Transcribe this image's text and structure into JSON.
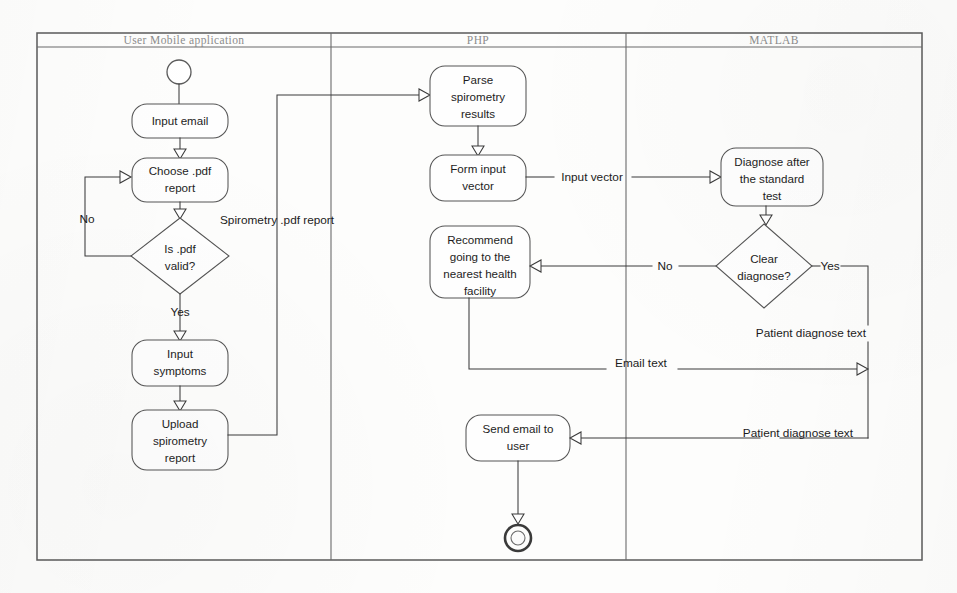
{
  "diagram": {
    "kind": "UML activity diagram with swimlanes",
    "frame": {
      "x": 37,
      "y": 33,
      "width": 885,
      "height": 527
    },
    "lanes": [
      {
        "id": "user",
        "title": "User Mobile application",
        "x": 37,
        "width": 294,
        "title_x": 184
      },
      {
        "id": "php",
        "title": "PHP",
        "x": 331,
        "width": 295,
        "title_x": 478
      },
      {
        "id": "matlab",
        "title": "MATLAB",
        "x": 626,
        "width": 296,
        "title_x": 774
      }
    ],
    "header_line_y": 47,
    "nodes": [
      {
        "id": "start",
        "type": "initial",
        "label": "",
        "cx": 179,
        "cy": 72,
        "r": 12
      },
      {
        "id": "input-email",
        "type": "action",
        "label": "Input email",
        "lines": [
          "Input email"
        ],
        "x": 132,
        "y": 104,
        "w": 96,
        "h": 34
      },
      {
        "id": "choose-pdf",
        "type": "action",
        "label": "Choose .pdf report",
        "lines": [
          "Choose .pdf",
          "report"
        ],
        "x": 132,
        "y": 158,
        "w": 96,
        "h": 44
      },
      {
        "id": "is-pdf-valid",
        "type": "decision",
        "label": "Is .pdf valid?",
        "lines": [
          "Is .pdf",
          "valid?"
        ],
        "cx": 180,
        "cy": 256,
        "rx": 49,
        "ry": 38
      },
      {
        "id": "input-symptoms",
        "type": "action",
        "label": "Input symptoms",
        "lines": [
          "Input",
          "symptoms"
        ],
        "x": 132,
        "y": 340,
        "w": 96,
        "h": 46
      },
      {
        "id": "upload-spirometry",
        "type": "action",
        "label": "Upload spirometry report",
        "lines": [
          "Upload",
          "spirometry",
          "report"
        ],
        "x": 132,
        "y": 410,
        "w": 96,
        "h": 60
      },
      {
        "id": "parse-spirometry",
        "type": "action",
        "label": "Parse spirometry results",
        "lines": [
          "Parse",
          "spirometry",
          "results"
        ],
        "x": 430,
        "y": 66,
        "w": 96,
        "h": 60
      },
      {
        "id": "form-input-vector",
        "type": "action",
        "label": "Form input vector",
        "lines": [
          "Form input",
          "vector"
        ],
        "x": 430,
        "y": 155,
        "w": 96,
        "h": 46
      },
      {
        "id": "recommend-facility",
        "type": "action",
        "label": "Recommend going to the nearest health facility",
        "lines": [
          "Recommend",
          "going to the",
          "nearest health",
          "facility"
        ],
        "x": 430,
        "y": 226,
        "w": 100,
        "h": 72
      },
      {
        "id": "send-email",
        "type": "action",
        "label": "Send email to user",
        "lines": [
          "Send email to",
          "user"
        ],
        "x": 466,
        "y": 415,
        "w": 104,
        "h": 46
      },
      {
        "id": "end",
        "type": "final",
        "label": "",
        "cx": 518,
        "cy": 538,
        "r": 14
      },
      {
        "id": "diagnose-standard",
        "type": "action",
        "label": "Diagnose after the standard test",
        "lines": [
          "Diagnose after",
          "the standard",
          "test"
        ],
        "x": 721,
        "y": 148,
        "w": 102,
        "h": 58
      },
      {
        "id": "clear-diagnose",
        "type": "decision",
        "label": "Clear diagnose?",
        "lines": [
          "Clear",
          "diagnose?"
        ],
        "cx": 764,
        "cy": 266,
        "rx": 48,
        "ry": 42
      }
    ],
    "edge_labels": [
      {
        "id": "no-pdf",
        "text": "No",
        "x": 87,
        "y": 223
      },
      {
        "id": "yes-pdf",
        "text": "Yes",
        "x": 180,
        "y": 312
      },
      {
        "id": "spirometry-report",
        "text": "Spirometry .pdf report",
        "x": 220,
        "y": 224
      },
      {
        "id": "input-vector",
        "text": "Input vector",
        "x": 592,
        "y": 179
      },
      {
        "id": "no-clear",
        "text": "No",
        "x": 665,
        "y": 268
      },
      {
        "id": "yes-clear",
        "text": "Yes",
        "x": 824,
        "y": 268
      },
      {
        "id": "patient-diagnose-text-1",
        "text": "Patient diagnose text",
        "x": 866,
        "y": 334
      },
      {
        "id": "email-text",
        "text": "Email text",
        "x": 641,
        "y": 365
      },
      {
        "id": "patient-diagnose-text-2",
        "text": "Patient diagnose text",
        "x": 853,
        "y": 435
      }
    ]
  }
}
